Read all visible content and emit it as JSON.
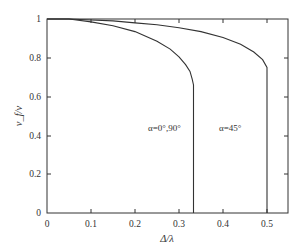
{
  "chart_data": {
    "type": "line",
    "title": "",
    "xlabel": "Δ/λ",
    "ylabel": "v_f/v",
    "xlim": [
      0,
      0.55
    ],
    "ylim": [
      0,
      1
    ],
    "xticks": [
      "0",
      "0.1",
      "0.2",
      "0.3",
      "0.4",
      "0.5"
    ],
    "yticks": [
      "0",
      "0.2",
      "0.4",
      "0.6",
      "0.8",
      "1"
    ],
    "grid": false,
    "legend": null,
    "series": [
      {
        "name": "α=0°,90°",
        "x": [
          0.0,
          0.05,
          0.1,
          0.15,
          0.2,
          0.25,
          0.28,
          0.3,
          0.315,
          0.325,
          0.33,
          0.333,
          0.333
        ],
        "y": [
          1.0,
          1.0,
          0.985,
          0.965,
          0.935,
          0.885,
          0.845,
          0.805,
          0.765,
          0.73,
          0.69,
          0.66,
          0.0
        ]
      },
      {
        "name": "α=45°",
        "x": [
          0.0,
          0.05,
          0.1,
          0.15,
          0.2,
          0.25,
          0.3,
          0.35,
          0.4,
          0.44,
          0.47,
          0.49,
          0.5,
          0.5
        ],
        "y": [
          1.0,
          1.0,
          0.995,
          0.99,
          0.98,
          0.97,
          0.955,
          0.935,
          0.905,
          0.87,
          0.83,
          0.79,
          0.75,
          0.0
        ]
      }
    ],
    "annotations": [
      {
        "text": "α=0°,90°",
        "x": 0.23,
        "y": 0.44
      },
      {
        "text": "α=45°",
        "x": 0.385,
        "y": 0.44
      }
    ]
  },
  "labels": {
    "xlabel": "Δ/λ",
    "ylabel": "v_f/v",
    "annot_0": "α=0°,90°",
    "annot_1": "α=45°",
    "x0": "0",
    "x1": "0.1",
    "x2": "0.2",
    "x3": "0.3",
    "x4": "0.4",
    "x5": "0.5",
    "y0": "0",
    "y1": "0.2",
    "y2": "0.4",
    "y3": "0.6",
    "y4": "0.8",
    "y5": "1"
  }
}
